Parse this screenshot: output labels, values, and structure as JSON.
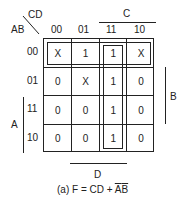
{
  "kmap": {
    "corner_row_var": "AB",
    "corner_col_var": "CD",
    "col_headers": [
      "00",
      "01",
      "11",
      "10"
    ],
    "row_headers": [
      "00",
      "01",
      "11",
      "10"
    ],
    "cells": [
      [
        "X",
        "1",
        "1",
        "X"
      ],
      [
        "0",
        "X",
        "1",
        "0"
      ],
      [
        "0",
        "0",
        "1",
        "0"
      ],
      [
        "0",
        "0",
        "1",
        "0"
      ]
    ],
    "bracket_labels": {
      "C": "C",
      "B": "B",
      "A": "A",
      "D": "D"
    }
  },
  "caption": {
    "prefix": "(a) F = CD + ",
    "a_bar": "A",
    "b_bar": "B"
  }
}
